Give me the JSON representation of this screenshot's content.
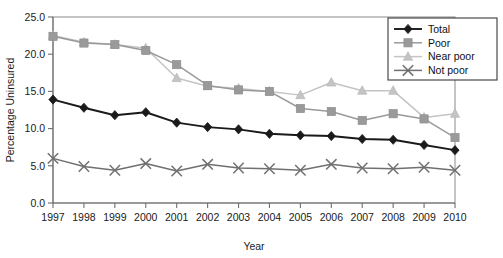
{
  "chart_data": {
    "type": "line",
    "title": "",
    "xlabel": "Year",
    "ylabel": "Percentage Uninsured",
    "categories": [
      "1997",
      "1998",
      "1999",
      "2000",
      "2001",
      "2002",
      "2003",
      "2004",
      "2005",
      "2006",
      "2007",
      "2008",
      "2009",
      "2010"
    ],
    "x": [
      1997,
      1998,
      1999,
      2000,
      2001,
      2002,
      2003,
      2004,
      2005,
      2006,
      2007,
      2008,
      2009,
      2010
    ],
    "xlim": [
      1997,
      2010
    ],
    "ylim": [
      0.0,
      25.0
    ],
    "yticks": [
      "0.0",
      "5.0",
      "10.0",
      "15.0",
      "20.0",
      "25.0"
    ],
    "ytick_values": [
      0.0,
      5.0,
      10.0,
      15.0,
      20.0,
      25.0
    ],
    "grid": false,
    "legend_position": "top-right",
    "series": [
      {
        "name": "Total",
        "marker": "diamond",
        "color": "#1a1a1a",
        "values": [
          13.9,
          12.8,
          11.8,
          12.2,
          10.8,
          10.2,
          9.9,
          9.3,
          9.1,
          9.0,
          8.6,
          8.5,
          7.8,
          7.1
        ]
      },
      {
        "name": "Poor",
        "marker": "square",
        "color": "#9a9a9a",
        "values": [
          22.4,
          21.5,
          21.3,
          20.5,
          18.6,
          15.8,
          15.2,
          15.0,
          12.7,
          12.3,
          11.1,
          12.0,
          11.3,
          8.8
        ]
      },
      {
        "name": "Near poor",
        "marker": "triangle",
        "color": "#c4c4c4",
        "values": [
          22.5,
          21.6,
          21.3,
          20.8,
          16.8,
          15.7,
          15.4,
          15.0,
          14.5,
          16.2,
          15.1,
          15.1,
          11.5,
          12.0
        ]
      },
      {
        "name": "Not poor",
        "marker": "x",
        "color": "#707070",
        "values": [
          6.0,
          4.9,
          4.4,
          5.3,
          4.3,
          5.2,
          4.7,
          4.6,
          4.4,
          5.2,
          4.7,
          4.6,
          4.8,
          4.4
        ]
      }
    ]
  },
  "legend": {
    "items": [
      {
        "label": "Total"
      },
      {
        "label": "Poor"
      },
      {
        "label": "Near poor"
      },
      {
        "label": "Not poor"
      }
    ]
  },
  "axes": {
    "y_title": "Percentage Uninsured",
    "x_title": "Year"
  }
}
